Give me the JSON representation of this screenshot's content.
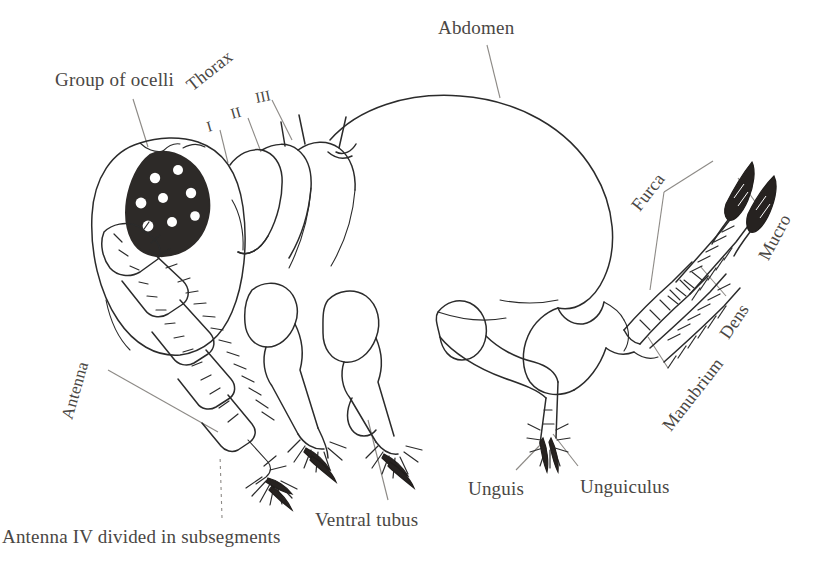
{
  "figure": {
    "background_color": "#ffffff",
    "ink_color": "#2b2b2b",
    "label_color": "#4a4744",
    "leader_line_color": "#8d8a86"
  },
  "labels": {
    "group_of_ocelli": "Group of ocelli",
    "abdomen": "Abdomen",
    "thorax": "Thorax",
    "thorax_segment_1": "I",
    "thorax_segment_2": "II",
    "thorax_segment_3": "III",
    "furca": "Furca",
    "mucro": "Mucro",
    "dens": "Dens",
    "manubrium": "Manubrium",
    "antenna": "Antenna",
    "unguis": "Unguis",
    "unguiculus": "Unguiculus",
    "ventral_tubus": "Ventral tubus",
    "antenna_iv": "Antenna IV divided in subsegments"
  },
  "ocelli": {
    "count": 8,
    "patch_color": "#2d2a28",
    "spot_color": "#ffffff"
  }
}
